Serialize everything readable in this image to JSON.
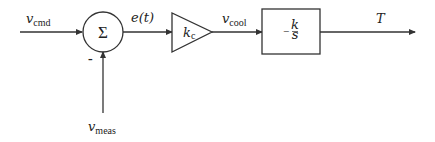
{
  "diagram": {
    "signals": {
      "input": {
        "main": "v",
        "sub": "cmd"
      },
      "feedback": {
        "main": "v",
        "sub": "meas"
      },
      "error": "e(t)",
      "control": {
        "main": "v",
        "sub": "cool"
      },
      "output": "T"
    },
    "blocks": {
      "summing_junction": {
        "symbol": "Σ",
        "minus_sign": "-"
      },
      "gain": {
        "main": "k",
        "sub": "c"
      },
      "integrator": {
        "sign": "−",
        "numerator": "k",
        "denominator": "s"
      }
    },
    "colors": {
      "line": "#333333",
      "background": "#ffffff"
    }
  }
}
